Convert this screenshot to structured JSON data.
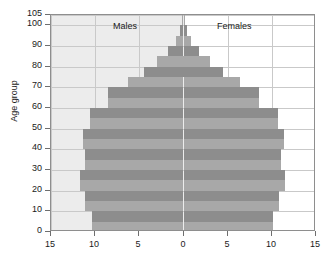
{
  "chart_data": {
    "type": "bar",
    "title": "",
    "subtitle": "",
    "xlabel": "",
    "ylabel": "Age group",
    "orientation": "horizontal",
    "style": "population-pyramid",
    "grid": true,
    "legend_position": "inside-top",
    "xlim": [
      -15,
      15
    ],
    "ylim": [
      0,
      105
    ],
    "x_tick_values": [
      -15,
      -10,
      -5,
      0,
      5,
      10,
      15
    ],
    "x_tick_labels": [
      "15",
      "10",
      "5",
      "0",
      "5",
      "10",
      "15"
    ],
    "y_tick_values": [
      0,
      10,
      20,
      30,
      40,
      50,
      60,
      70,
      80,
      90,
      100,
      105
    ],
    "y_tick_labels": [
      "0",
      "10",
      "20",
      "30",
      "40",
      "50",
      "60",
      "70",
      "80",
      "90",
      "100",
      "105"
    ],
    "categories": [
      "0-5",
      "5-10",
      "10-15",
      "15-20",
      "20-25",
      "25-30",
      "30-35",
      "35-40",
      "40-45",
      "45-50",
      "50-55",
      "55-60",
      "60-65",
      "65-70",
      "70-75",
      "75-80",
      "80-85",
      "85-90",
      "90-95",
      "95-100",
      "100-105"
    ],
    "series": [
      {
        "name": "Males",
        "side": "left",
        "color": "#a8a8a8",
        "values": [
          10.4,
          10.4,
          11.1,
          11.1,
          11.7,
          11.7,
          11.1,
          11.1,
          11.4,
          11.4,
          10.6,
          10.6,
          8.6,
          8.6,
          6.3,
          4.5,
          3.0,
          1.8,
          0.9,
          0.4,
          0.2
        ]
      },
      {
        "name": "Females",
        "side": "right",
        "color": "#a8a8a8",
        "values": [
          10.1,
          10.1,
          10.8,
          10.8,
          11.5,
          11.5,
          11.0,
          11.0,
          11.4,
          11.4,
          10.7,
          10.7,
          8.6,
          8.6,
          6.4,
          4.5,
          3.0,
          1.8,
          0.9,
          0.4,
          0.2
        ]
      }
    ],
    "annotations": [
      {
        "text": "Males",
        "x": -7.5,
        "y": 101
      },
      {
        "text": "Females",
        "x": 6.0,
        "y": 101
      }
    ]
  },
  "chart_meta": {
    "males_label": "Males",
    "females_label": "Females",
    "axis_title_y": "Age group"
  }
}
